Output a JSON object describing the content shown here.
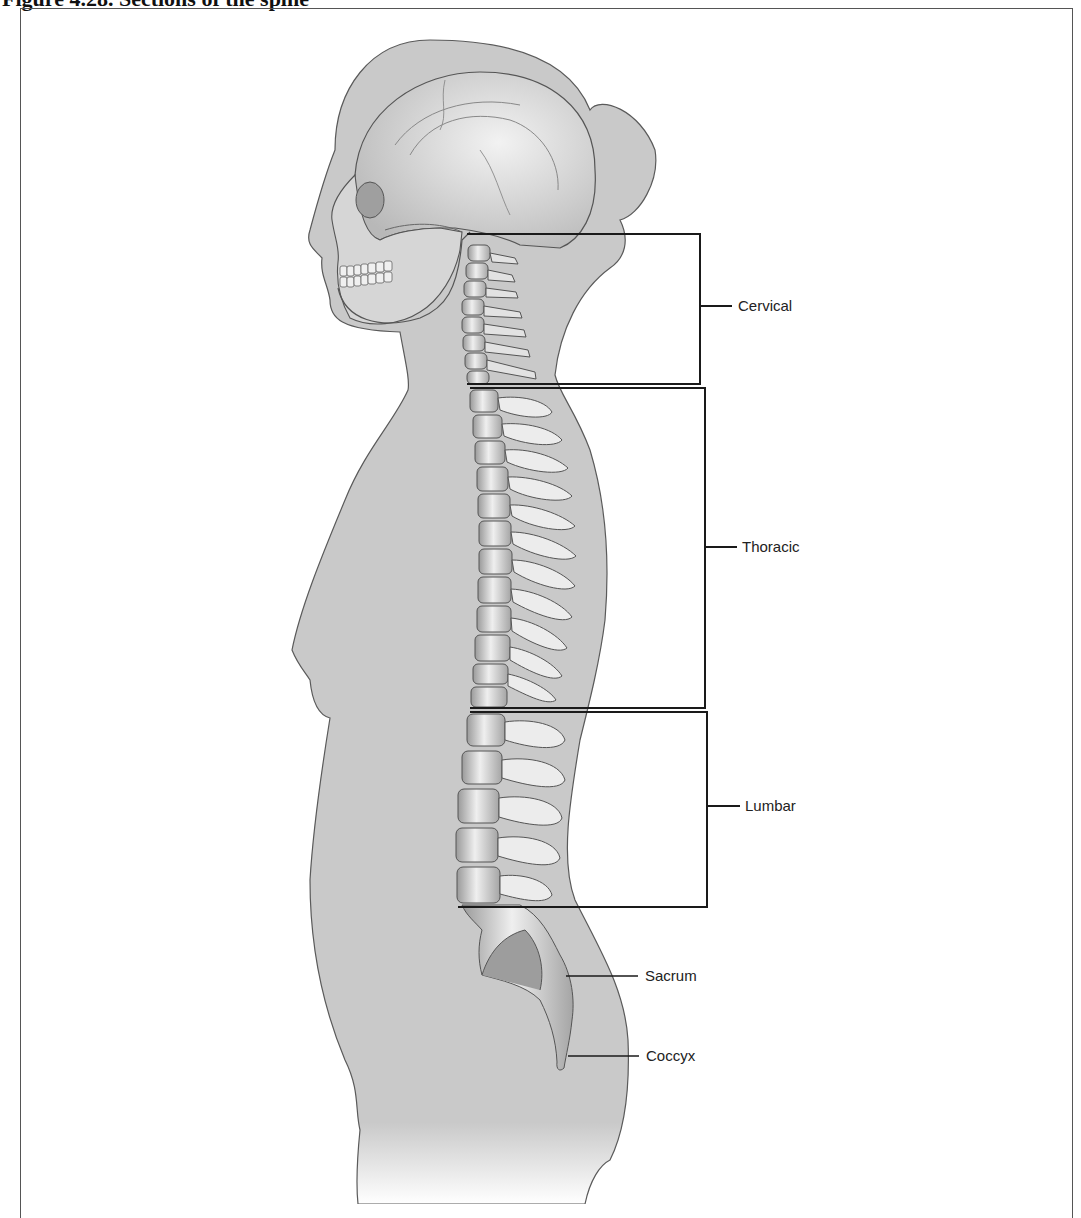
{
  "figure": {
    "title": "Figure 4.28.  Sections of the spine"
  },
  "labels": [
    {
      "id": "cervical",
      "text": "Cervical"
    },
    {
      "id": "thoracic",
      "text": "Thoracic"
    },
    {
      "id": "lumbar",
      "text": "Lumbar"
    },
    {
      "id": "sacrum",
      "text": "Sacrum"
    },
    {
      "id": "coccyx",
      "text": "Coccyx"
    }
  ],
  "colors": {
    "body_fill": "#c9c9c9",
    "outline": "#5a5a5a",
    "bone_fill": "#e6e6e6",
    "bone_shadow": "#8a8a8a",
    "bracket": "#1a1a1a"
  }
}
